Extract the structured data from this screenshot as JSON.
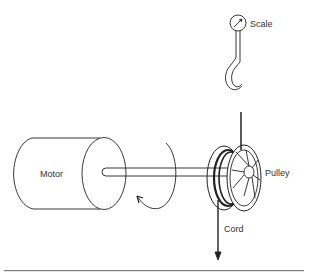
{
  "diagram": {
    "labels": {
      "motor": "Motor",
      "pulley": "Pulley",
      "scale": "Scale",
      "cord": "Cord"
    },
    "components": [
      "motor",
      "shaft",
      "rotation-arrow",
      "pulley",
      "cord",
      "scale",
      "hook"
    ],
    "colors": {
      "stroke": "#222222",
      "background": "#ffffff"
    }
  }
}
